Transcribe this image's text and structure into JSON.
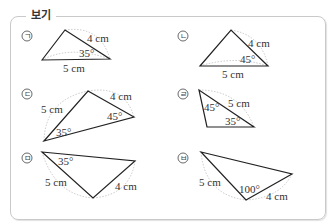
{
  "box": {
    "title": "보기"
  },
  "items": [
    {
      "marker": "㉠",
      "labels": [
        "4 cm",
        "35°",
        "5 cm"
      ]
    },
    {
      "marker": "㉡",
      "labels": [
        "4 cm",
        "45°",
        "5 cm"
      ]
    },
    {
      "marker": "㉢",
      "labels": [
        "5 cm",
        "4 cm",
        "45°",
        "35°"
      ]
    },
    {
      "marker": "㉣",
      "labels": [
        "5 cm",
        "45°",
        "35°"
      ]
    },
    {
      "marker": "㉤",
      "labels": [
        "35°",
        "5 cm",
        "4 cm"
      ]
    },
    {
      "marker": "㉥",
      "labels": [
        "5 cm",
        "100°",
        "4 cm"
      ]
    }
  ]
}
